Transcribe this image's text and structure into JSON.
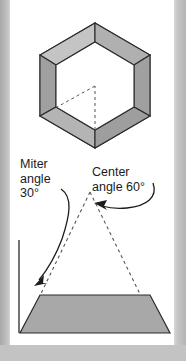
{
  "figure": {
    "title_text_present": false,
    "page_background": "#ffffff",
    "surround_background": "#bdbdbd",
    "line_color": "#1c1c1c",
    "fill_gray": "#a8a8a8",
    "fill_gray_light": "#b5b5b5",
    "dashed_color": "#6b6b6b"
  },
  "labels": {
    "miter": {
      "line1": "Miter",
      "line2": "angle",
      "line3": "30°",
      "full": "Miter angle 30°",
      "angle_value": 30,
      "angle_unit": "degrees"
    },
    "center": {
      "line1": "Center",
      "line2": "angle 60°",
      "full": "Center angle 60°",
      "angle_value": 60,
      "angle_unit": "degrees"
    }
  },
  "shapes": {
    "hexagon_frame": {
      "name": "hexagonal-picture-frame",
      "sides": 6,
      "outer_points": "95,23 150,55 150,116 95,148 40,116 40,55",
      "inner_points": "95,42 134,65 134,107 95,130 56,107 56,65",
      "dashed_center_lines": [
        "95,130 95,86",
        "95,86 57,107"
      ]
    },
    "center_triangle": {
      "name": "dashed-center-angle-triangle",
      "apex": "90,192",
      "left_base": "22,333",
      "right_base": "159,333",
      "style": "dashed"
    },
    "frame_segment": {
      "name": "frame-segment-trapezoid",
      "points": "40,295 150,295 170,333 20,333",
      "fill": "#a8a8a8"
    },
    "vertical_reference_line": {
      "name": "vertical-reference-line",
      "from": "19,240",
      "to": "19,333"
    }
  },
  "arrows": {
    "miter_arrow": {
      "name": "miter-angle-arrow",
      "path": "M 61,189 C 72,196 70,214 62,238 C 56,254 48,268 38,281",
      "head_at": "35,285",
      "direction": "down-left"
    },
    "center_arrow": {
      "name": "center-angle-arrow",
      "path": "M 152,183 C 156,196 148,205 128,207 C 117,208 108,207 100,205",
      "head_at": "95,204",
      "direction": "left"
    }
  }
}
